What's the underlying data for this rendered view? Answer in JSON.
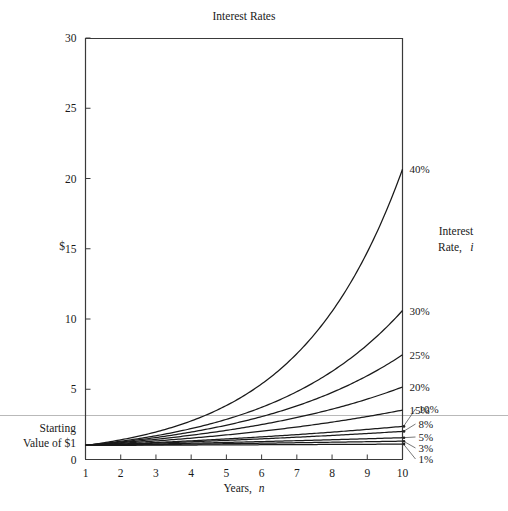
{
  "chart_data": {
    "type": "line",
    "title": "Interest Rates",
    "xlabel": "Years, n",
    "ylabel": "$",
    "xlim": [
      1,
      10
    ],
    "ylim": [
      0,
      30
    ],
    "grid": false,
    "legend_position": "right-of-plot",
    "legend_title_line1": "Interest",
    "legend_title_line2": "Rate,",
    "legend_title_line3": "i",
    "annotation": {
      "line1": "Starting",
      "line2": "Value of $1",
      "value": 1
    },
    "x": [
      1,
      2,
      3,
      4,
      5,
      6,
      7,
      8,
      9,
      10
    ],
    "xticklabels": [
      "1",
      "2",
      "3",
      "4",
      "5",
      "6",
      "7",
      "8",
      "9",
      "10"
    ],
    "yticks": [
      0,
      5,
      10,
      15,
      20,
      25,
      30
    ],
    "yticklabels": [
      "0",
      "5",
      "10",
      "15",
      "20",
      "25",
      "30"
    ],
    "series": [
      {
        "name": "40%",
        "rate": 0.4,
        "label": "40%",
        "values": [
          1.0,
          1.4,
          1.96,
          2.74,
          3.84,
          5.38,
          7.53,
          10.54,
          14.76,
          20.66
        ]
      },
      {
        "name": "30%",
        "rate": 0.3,
        "label": "30%",
        "values": [
          1.0,
          1.3,
          1.69,
          2.2,
          2.86,
          3.71,
          4.83,
          6.27,
          8.16,
          10.6
        ]
      },
      {
        "name": "25%",
        "rate": 0.25,
        "label": "25%",
        "values": [
          1.0,
          1.25,
          1.56,
          1.95,
          2.44,
          3.05,
          3.81,
          4.77,
          5.96,
          7.45
        ]
      },
      {
        "name": "20%",
        "rate": 0.2,
        "label": "20%",
        "values": [
          1.0,
          1.2,
          1.44,
          1.73,
          2.07,
          2.49,
          2.99,
          3.58,
          4.3,
          5.16
        ]
      },
      {
        "name": "15%",
        "rate": 0.15,
        "label": "15%",
        "values": [
          1.0,
          1.15,
          1.32,
          1.52,
          1.75,
          2.01,
          2.31,
          2.66,
          3.06,
          3.52
        ]
      },
      {
        "name": "10%",
        "rate": 0.1,
        "label": "10%",
        "values": [
          1.0,
          1.1,
          1.21,
          1.33,
          1.46,
          1.61,
          1.77,
          1.95,
          2.14,
          2.36
        ]
      },
      {
        "name": "8%",
        "rate": 0.08,
        "label": "8%",
        "values": [
          1.0,
          1.08,
          1.17,
          1.26,
          1.36,
          1.47,
          1.59,
          1.71,
          1.85,
          2.0
        ]
      },
      {
        "name": "5%",
        "rate": 0.05,
        "label": "5%",
        "values": [
          1.0,
          1.05,
          1.1,
          1.16,
          1.22,
          1.28,
          1.34,
          1.41,
          1.48,
          1.55
        ]
      },
      {
        "name": "3%",
        "rate": 0.03,
        "label": "3%",
        "values": [
          1.0,
          1.03,
          1.06,
          1.09,
          1.13,
          1.16,
          1.19,
          1.23,
          1.27,
          1.3
        ]
      },
      {
        "name": "1%",
        "rate": 0.01,
        "label": "1%",
        "values": [
          1.0,
          1.01,
          1.02,
          1.03,
          1.04,
          1.05,
          1.06,
          1.07,
          1.08,
          1.09
        ]
      }
    ]
  }
}
